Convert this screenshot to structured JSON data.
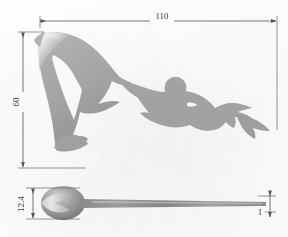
{
  "drawing": {
    "title": "Dolphin and diver ornament - dimensioned drawing",
    "units": "mm",
    "colors": {
      "silhouette_fill": "#a8a8a8",
      "silhouette_fill_light": "#bdbdbd",
      "silhouette_fill_dark": "#8d8d8d",
      "highlight": "#f2f2f2",
      "dimension_line": "#555555",
      "extension_line": "#6a6a6a",
      "text": "#3b3b3b",
      "background": "#ffffff"
    },
    "views": [
      {
        "name": "front-view",
        "label": "front elevation",
        "subjects": [
          "dolphin-silhouette",
          "diver-silhouette"
        ]
      },
      {
        "name": "side-view",
        "label": "side / edge elevation",
        "subjects": [
          "dolphin-body-profile",
          "tapered-blade"
        ]
      }
    ],
    "dimensions": [
      {
        "name": "overall-width",
        "value": "110",
        "orientation": "horizontal",
        "view": "front-view",
        "position": "top"
      },
      {
        "name": "overall-height",
        "value": "60",
        "orientation": "vertical",
        "view": "front-view",
        "position": "left",
        "rotated": true
      },
      {
        "name": "body-thickness",
        "value": "12.4",
        "orientation": "vertical",
        "view": "side-view",
        "position": "left",
        "rotated": true
      },
      {
        "name": "blade-thickness",
        "value": "1",
        "orientation": "vertical",
        "view": "side-view",
        "position": "right"
      }
    ]
  }
}
